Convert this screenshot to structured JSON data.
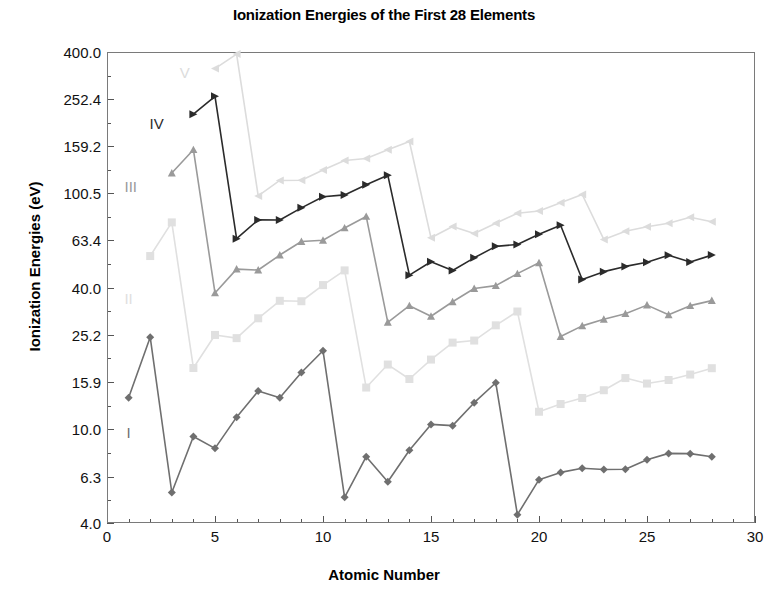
{
  "chart": {
    "title": "Ionization Energies of the First 28 Elements",
    "xlabel": "Atomic Number",
    "ylabel": "Ionization Energies (eV)"
  },
  "chart_data": {
    "type": "line",
    "title": "Ionization Energies of the First 28 Elements",
    "xlabel": "Atomic Number",
    "ylabel": "Ionization Energies (eV)",
    "yscale": "log",
    "ylim": [
      4.0,
      400.0
    ],
    "xlim": [
      0,
      30
    ],
    "grid": false,
    "legend_position": "inline-labels",
    "ytick_labels": [
      "400.0",
      "252.4",
      "159.2",
      "100.5",
      "63.4",
      "40.0",
      "25.2",
      "15.9",
      "10.0",
      "6.3",
      "4.0"
    ],
    "ytick_values": [
      400.0,
      252.4,
      159.2,
      100.5,
      63.4,
      40.0,
      25.2,
      15.9,
      10.0,
      6.3,
      4.0
    ],
    "xtick_labels": [
      "0",
      "5",
      "10",
      "15",
      "20",
      "25",
      "30"
    ],
    "xtick_values": [
      0,
      5,
      10,
      15,
      20,
      25,
      30
    ],
    "series": [
      {
        "name": "I",
        "label": "I",
        "color": "#6f6f6f",
        "marker": "diamond",
        "label_x": 1.0,
        "label_y": 9.7,
        "x": [
          1,
          2,
          3,
          4,
          5,
          6,
          7,
          8,
          9,
          10,
          11,
          12,
          13,
          14,
          15,
          16,
          17,
          18,
          19,
          20,
          21,
          22,
          23,
          24,
          25,
          26,
          27,
          28
        ],
        "values": [
          13.6,
          24.6,
          5.39,
          9.32,
          8.3,
          11.26,
          14.53,
          13.62,
          17.42,
          21.56,
          5.14,
          7.65,
          5.99,
          8.15,
          10.49,
          10.36,
          12.97,
          15.76,
          4.34,
          6.11,
          6.56,
          6.83,
          6.75,
          6.77,
          7.43,
          7.9,
          7.88,
          7.64
        ]
      },
      {
        "name": "II",
        "label": "II",
        "color": "#e0e0e0",
        "marker": "square",
        "label_x": 1.0,
        "label_y": 36.0,
        "x": [
          2,
          3,
          4,
          5,
          6,
          7,
          8,
          9,
          10,
          11,
          12,
          13,
          14,
          15,
          16,
          17,
          18,
          19,
          20,
          21,
          22,
          23,
          24,
          25,
          26,
          27,
          28
        ],
        "values": [
          54.4,
          75.6,
          18.21,
          25.15,
          24.38,
          29.6,
          35.12,
          34.97,
          40.96,
          47.29,
          15.04,
          18.83,
          16.35,
          19.77,
          23.34,
          23.81,
          27.63,
          31.63,
          11.87,
          12.8,
          13.58,
          14.65,
          16.5,
          15.64,
          16.19,
          17.08,
          18.17
        ]
      },
      {
        "name": "III",
        "label": "III",
        "color": "#9a9a9a",
        "marker": "triangle",
        "label_x": 1.1,
        "label_y": 108.0,
        "x": [
          3,
          4,
          5,
          6,
          7,
          8,
          9,
          10,
          11,
          12,
          13,
          14,
          15,
          16,
          17,
          18,
          19,
          20,
          21,
          22,
          23,
          24,
          25,
          26,
          27,
          28
        ],
        "values": [
          122.5,
          153.9,
          37.93,
          47.89,
          47.45,
          54.94,
          62.71,
          63.45,
          71.62,
          80.14,
          28.45,
          33.49,
          30.2,
          34.79,
          39.61,
          40.74,
          45.81,
          50.91,
          24.76,
          27.49,
          29.31,
          30.96,
          33.67,
          30.65,
          33.5,
          35.19
        ]
      },
      {
        "name": "IV",
        "label": "IV",
        "color": "#2b2b2b",
        "marker": "triangle-right",
        "label_x": 2.3,
        "label_y": 200.0,
        "x": [
          4,
          5,
          6,
          7,
          8,
          9,
          10,
          11,
          12,
          13,
          14,
          15,
          16,
          17,
          18,
          19,
          20,
          21,
          22,
          23,
          24,
          25,
          26,
          27,
          28
        ],
        "values": [
          217.7,
          259.4,
          64.49,
          77.47,
          77.41,
          87.14,
          97.12,
          98.91,
          109.3,
          119.99,
          45.14,
          51.44,
          47.22,
          53.47,
          59.81,
          60.91,
          67.27,
          73.49,
          43.27,
          46.71,
          49.16,
          51.2,
          54.8,
          51.3,
          54.9
        ]
      },
      {
        "name": "V",
        "label": "V",
        "color": "#dcdcdc",
        "marker": "triangle-left",
        "label_x": 3.6,
        "label_y": 330.0,
        "x": [
          5,
          6,
          7,
          8,
          9,
          10,
          11,
          12,
          13,
          14,
          15,
          16,
          17,
          18,
          19,
          20,
          21,
          22,
          23,
          24,
          25,
          26,
          27,
          28
        ],
        "values": [
          340.2,
          392.1,
          97.89,
          113.9,
          114.2,
          126.2,
          138.4,
          141.3,
          153.8,
          166.8,
          65.02,
          72.68,
          67.8,
          75.0,
          82.66,
          84.5,
          91.65,
          99.3,
          64.0,
          69.3,
          72.4,
          75.0,
          79.5,
          76.1
        ]
      }
    ]
  }
}
